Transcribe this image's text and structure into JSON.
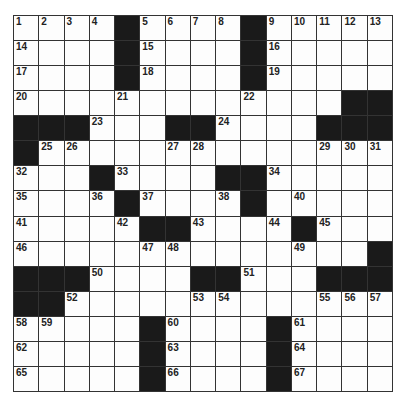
{
  "puzzle": {
    "rows": 15,
    "cols": 15,
    "colors": {
      "block": "#1a1a1a",
      "cell": "#fdfdfd",
      "line": "#333333"
    },
    "layout": [
      "....#....#.....",
      "....#....#.....",
      "....#....#.....",
      ".............##",
      "###...##....###",
      "#..............",
      "...#....##.....",
      "....#....#.....",
      ".....##....#...",
      "..............#",
      "###....##...###",
      "##.............",
      ".....#....#....",
      ".....#....#....",
      ".....#....#...."
    ],
    "numbers": [
      [
        1,
        2,
        3,
        4,
        0,
        5,
        6,
        7,
        8,
        0,
        9,
        10,
        11,
        12,
        13
      ],
      [
        14,
        0,
        0,
        0,
        0,
        15,
        0,
        0,
        0,
        0,
        16,
        0,
        0,
        0,
        0
      ],
      [
        17,
        0,
        0,
        0,
        0,
        18,
        0,
        0,
        0,
        0,
        19,
        0,
        0,
        0,
        0
      ],
      [
        20,
        0,
        0,
        0,
        21,
        0,
        0,
        0,
        0,
        22,
        0,
        0,
        0,
        0,
        0
      ],
      [
        0,
        0,
        0,
        23,
        0,
        0,
        0,
        0,
        24,
        0,
        0,
        0,
        0,
        0,
        0
      ],
      [
        0,
        25,
        26,
        0,
        0,
        0,
        27,
        28,
        0,
        0,
        0,
        0,
        29,
        30,
        31
      ],
      [
        32,
        0,
        0,
        0,
        33,
        0,
        0,
        0,
        0,
        0,
        34,
        0,
        0,
        0,
        0
      ],
      [
        35,
        0,
        0,
        36,
        0,
        37,
        0,
        0,
        38,
        39,
        0,
        40,
        0,
        0,
        0
      ],
      [
        41,
        0,
        0,
        0,
        42,
        0,
        0,
        43,
        0,
        0,
        44,
        0,
        45,
        0,
        0
      ],
      [
        46,
        0,
        0,
        0,
        0,
        47,
        48,
        0,
        0,
        0,
        0,
        49,
        0,
        0,
        0
      ],
      [
        0,
        0,
        0,
        50,
        0,
        0,
        0,
        0,
        0,
        51,
        0,
        0,
        0,
        0,
        0
      ],
      [
        0,
        0,
        52,
        0,
        0,
        0,
        0,
        53,
        54,
        0,
        0,
        0,
        55,
        56,
        57
      ],
      [
        58,
        59,
        0,
        0,
        0,
        0,
        60,
        0,
        0,
        0,
        0,
        61,
        0,
        0,
        0
      ],
      [
        62,
        0,
        0,
        0,
        0,
        0,
        63,
        0,
        0,
        0,
        0,
        64,
        0,
        0,
        0
      ],
      [
        65,
        0,
        0,
        0,
        0,
        0,
        66,
        0,
        0,
        0,
        0,
        67,
        0,
        0,
        0
      ]
    ],
    "letters": []
  }
}
